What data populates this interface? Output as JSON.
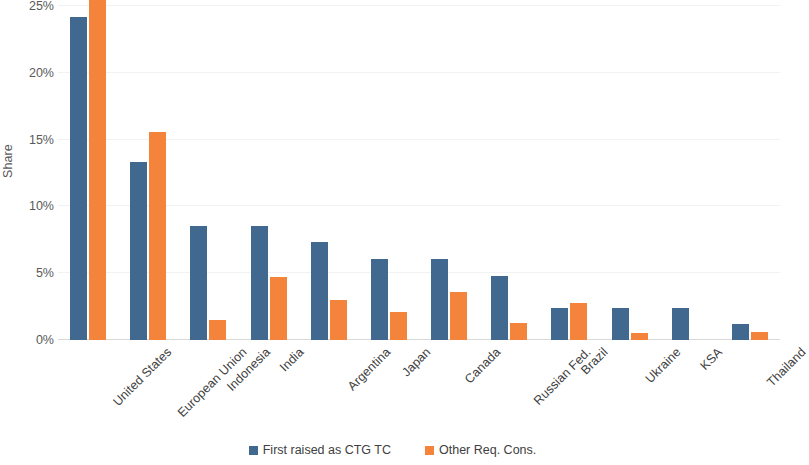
{
  "chart_data": {
    "type": "bar",
    "title": "",
    "xlabel": "",
    "ylabel": "Share",
    "ylim": [
      0,
      25
    ],
    "ytick_labels": [
      "25%",
      "20%",
      "15%",
      "10%",
      "5%",
      "0%"
    ],
    "ytick_values": [
      25,
      20,
      15,
      10,
      5,
      0
    ],
    "grid": true,
    "legend_position": "bottom",
    "categories": [
      "United States",
      "European Union",
      "Indonesia",
      "India",
      "Argentina",
      "Japan",
      "Canada",
      "Russian Fed.",
      "Brazil",
      "Ukraine",
      "KSA",
      "Thailand"
    ],
    "series": [
      {
        "name": "First raised as CTG TC",
        "color": "#41688F",
        "values": [
          24.2,
          13.3,
          8.5,
          8.5,
          7.3,
          6.1,
          6.1,
          4.8,
          2.4,
          2.4,
          2.4,
          1.2
        ]
      },
      {
        "name": "Other Req. Cons.",
        "color": "#F4843C",
        "values": [
          25.8,
          15.6,
          1.5,
          4.7,
          3.0,
          2.1,
          3.6,
          1.3,
          2.8,
          0.5,
          0.0,
          0.6
        ]
      }
    ]
  }
}
